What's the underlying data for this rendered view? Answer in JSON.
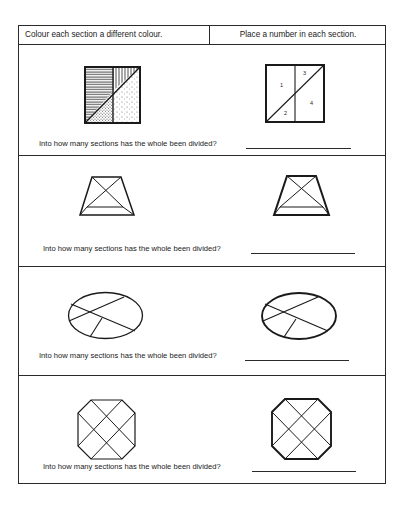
{
  "header": {
    "left_instruction": "Colour each section a different colour.",
    "right_instruction": "Place a number in each section."
  },
  "rows": [
    {
      "shape": "square-divided",
      "question": "Into how many sections has the whole been divided?",
      "answer": "",
      "section_numbers": [
        "1",
        "3",
        "2",
        "4"
      ]
    },
    {
      "shape": "trapezoid-divided",
      "question": "Into how many sections has the whole been divided?",
      "answer": ""
    },
    {
      "shape": "ellipse-divided",
      "question": "Into how many sections has the whole been divided?",
      "answer": ""
    },
    {
      "shape": "octagon-divided",
      "question": "Into how many sections has the whole been divided?",
      "answer": ""
    }
  ],
  "colors": {
    "ink": "#1a1a1a",
    "paper": "#ffffff"
  }
}
